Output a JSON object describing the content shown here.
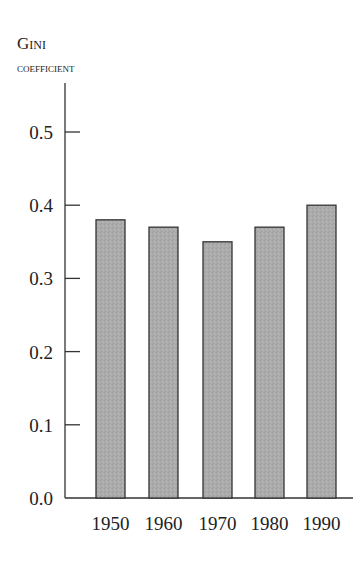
{
  "chart_data": {
    "type": "bar",
    "title": "",
    "ylabel": [
      "Gini",
      "coefficient"
    ],
    "xlabel": "",
    "categories": [
      "1950",
      "1960",
      "1970",
      "1980",
      "1990"
    ],
    "values": [
      0.38,
      0.37,
      0.35,
      0.37,
      0.4
    ],
    "ylim": [
      0.0,
      0.5
    ],
    "yticks": [
      "0.0",
      "0.1",
      "0.2",
      "0.3",
      "0.4",
      "0.5"
    ],
    "grid": false,
    "legend": null,
    "colors": {
      "bar_fill": "#ababab",
      "bar_stroke": "#333333",
      "axis": "#333333"
    }
  }
}
